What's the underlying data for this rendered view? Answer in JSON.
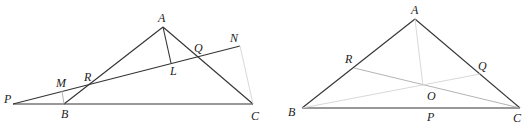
{
  "figures": [
    {
      "id": "left",
      "points": {
        "P": {
          "label": "P",
          "x": 13,
          "y": 104
        },
        "B": {
          "label": "B",
          "x": 64,
          "y": 104
        },
        "C": {
          "label": "C",
          "x": 253,
          "y": 104
        },
        "A": {
          "label": "A",
          "x": 163,
          "y": 27
        },
        "N": {
          "label": "N",
          "x": 240,
          "y": 46
        },
        "R": {
          "label": "R",
          "x": 88,
          "y": 85
        },
        "Q": {
          "label": "Q",
          "x": 197,
          "y": 57
        },
        "M": {
          "label": "M",
          "x": 62,
          "y": 90
        },
        "L": {
          "label": "L",
          "x": 171,
          "y": 63
        }
      },
      "segments": [
        "PC",
        "AB",
        "AC",
        "PN",
        "AL",
        "BM",
        "NC"
      ]
    },
    {
      "id": "right",
      "points": {
        "A": {
          "label": "A",
          "x": 415,
          "y": 19
        },
        "B": {
          "label": "B",
          "x": 302,
          "y": 108
        },
        "C": {
          "label": "C",
          "x": 520,
          "y": 108
        },
        "R": {
          "label": "R",
          "x": 354,
          "y": 68
        },
        "Q": {
          "label": "Q",
          "x": 480,
          "y": 74
        },
        "O": {
          "label": "O",
          "x": 423,
          "y": 85
        },
        "P": {
          "label": "P",
          "x": 432,
          "y": 108
        }
      },
      "segments": [
        "AB",
        "AC",
        "BC",
        "RC",
        "BQ",
        "AO"
      ]
    }
  ]
}
